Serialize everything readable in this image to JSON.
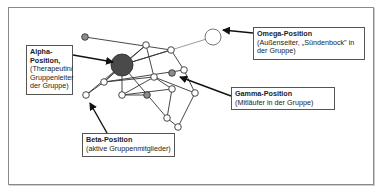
{
  "diagram": {
    "type": "group-position-network",
    "labels": {
      "alpha": {
        "title": "Alpha-Position,",
        "title_line1": "Alpha-",
        "title_line2": "Position,",
        "desc": "(Therapeutin/ Gruppenleiter der Gruppe)"
      },
      "omega": {
        "title": "Omega-Position",
        "desc": "(Außenseiter, „Sündenbock\" in der Gruppe)"
      },
      "gamma": {
        "title": "Gamma-Position",
        "desc": "(Mitläufer in der Gruppe)"
      },
      "beta": {
        "title": "Beta-Position",
        "desc": "(aktive Gruppenmitglieder)"
      }
    },
    "node_kinds": {
      "alpha": "large dark node",
      "omega": "large open node",
      "gamma": "small gray node",
      "beta": "small open node"
    },
    "colors": {
      "alpha_fill": "#4a4a4a",
      "gamma_fill": "#8c8c8c",
      "open_fill": "#ffffff",
      "stroke": "#333333",
      "omega_edge": "#9a9a9a"
    }
  }
}
